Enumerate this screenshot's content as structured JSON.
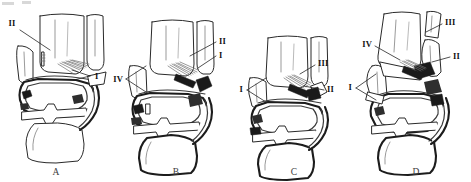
{
  "figure": {
    "kind": "anatomical-line-drawing",
    "view": "coronal (frontal) section of ankle showing tibia, fibula, talus and calcaneus",
    "panel_count": 4,
    "background_color": "#ffffff",
    "ink_color": "#1a1a1a",
    "accent_fill": "#2e2e2e",
    "panels": [
      {
        "id": "A",
        "panel_label": "A",
        "label_x": 56,
        "label_y": 172,
        "callouts": [
          {
            "text": "II",
            "x": 12,
            "y": 25,
            "anchor_x": 48,
            "anchor_y": 48,
            "side": "left"
          },
          {
            "text": "I",
            "x": 94,
            "y": 76,
            "anchor_x": 70,
            "anchor_y": 72,
            "side": "right"
          }
        ]
      },
      {
        "id": "B",
        "panel_label": "B",
        "label_x": 176,
        "label_y": 172,
        "callouts": [
          {
            "text": "II",
            "x": 219,
            "y": 41,
            "anchor_x": 188,
            "anchor_y": 56,
            "side": "right"
          },
          {
            "text": "I",
            "x": 219,
            "y": 55,
            "anchor_x": 196,
            "anchor_y": 66,
            "side": "right"
          },
          {
            "text": "IV",
            "x": 119,
            "y": 79,
            "anchor_x": 142,
            "anchor_y": 72,
            "side": "left"
          }
        ]
      },
      {
        "id": "C",
        "panel_label": "C",
        "label_x": 294,
        "label_y": 172,
        "callouts": [
          {
            "text": "III",
            "x": 318,
            "y": 63,
            "anchor_x": 300,
            "anchor_y": 72,
            "side": "right"
          },
          {
            "text": "II",
            "x": 327,
            "y": 90,
            "anchor_x": 303,
            "anchor_y": 84,
            "side": "right"
          },
          {
            "text": "I",
            "x": 240,
            "y": 90,
            "anchor_x": 262,
            "anchor_y": 82,
            "side": "left"
          }
        ]
      },
      {
        "id": "D",
        "panel_label": "D",
        "label_x": 416,
        "label_y": 172,
        "callouts": [
          {
            "text": "III",
            "x": 445,
            "y": 22,
            "anchor_x": 425,
            "anchor_y": 32,
            "side": "right"
          },
          {
            "text": "II",
            "x": 453,
            "y": 56,
            "anchor_x": 430,
            "anchor_y": 60,
            "side": "right"
          },
          {
            "text": "IV",
            "x": 366,
            "y": 44,
            "anchor_x": 395,
            "anchor_y": 58,
            "side": "left"
          },
          {
            "text": "I",
            "x": 349,
            "y": 88,
            "anchor_x": 372,
            "anchor_y": 80,
            "side": "left"
          }
        ]
      }
    ],
    "legend_numerals": [
      "I",
      "II",
      "III",
      "IV"
    ]
  }
}
